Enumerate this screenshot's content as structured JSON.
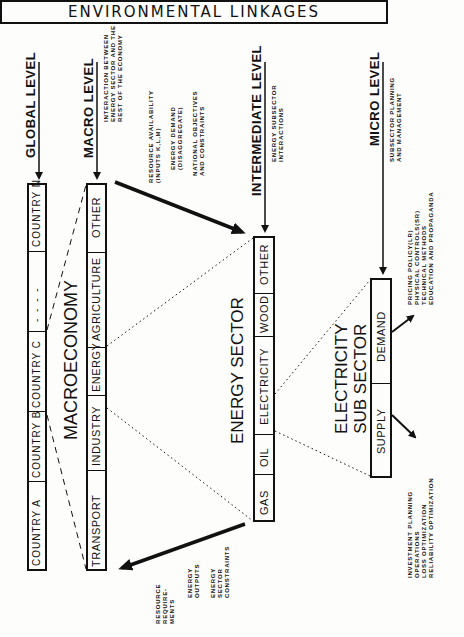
{
  "title": "ENVIRONMENTAL LINKAGES",
  "levels": {
    "global": {
      "label": "GLOBAL LEVEL"
    },
    "macro": {
      "label": "MACRO LEVEL",
      "note": [
        "INTERACTION BETWEEN",
        "ENERGY SECTOR AND THE",
        "REST OF THE ECONOMY"
      ]
    },
    "intermediate": {
      "label": "INTERMEDIATE LEVEL",
      "note": [
        "ENERGY SUBSECTOR",
        "INTERACTIONS"
      ]
    },
    "micro": {
      "label": "MICRO LEVEL",
      "note": [
        "SUBSECTOR PLANNING",
        "AND MANAGEMENT"
      ]
    }
  },
  "countries": {
    "cells": [
      "COUNTRY A",
      "COUNTRY B",
      "COUNTRY C",
      "- - - -",
      "COUNTRY N"
    ]
  },
  "macroeconomy": {
    "label": "MACROECONOMY",
    "cells": [
      "TRANSPORT",
      "INDUSTRY",
      "ENERGY",
      "AGRICULTURE",
      "OTHER"
    ]
  },
  "energy_sector": {
    "label": "ENERGY SECTOR",
    "cells": [
      "GAS",
      "OIL",
      "ELECTRICITY",
      "WOOD",
      "OTHER"
    ]
  },
  "electricity_subsector": {
    "label_line1": "ELECTRICITY",
    "label_line2": "SUB SECTOR",
    "cells": [
      "SUPPLY",
      "DEMAND"
    ]
  },
  "macro_to_energy_inputs": {
    "group1": [
      "RESOURCE AVAILABILITY",
      "(INPUTS K,L,M)"
    ],
    "group2": [
      "ENERGY DEMAND",
      "(DISAGGREGATE)"
    ],
    "group3": [
      "NATIONAL OBJECTIVES",
      "AND CONSTRAINTS"
    ]
  },
  "energy_to_macro_outputs": {
    "group1": [
      "RESOURCE",
      "REQUIRE-",
      "MENTS"
    ],
    "group2": [
      "ENERGY",
      "OUTPUTS"
    ],
    "group3": [
      "ENERGY",
      "SECTOR",
      "CONSTRAINTS"
    ]
  },
  "demand_actions": [
    "PRICING POLICY(LR)",
    "PHYSICAL CONTROLS(SR)",
    "TECHNICAL METHODS",
    "EDUCATION AND PROPAGANDA"
  ],
  "supply_actions": [
    "INVESTMENT PLANNING",
    "OPERATIONS",
    "LOSS OPTIMIZATION",
    "RELIABILITY OPTIMIZATION"
  ]
}
